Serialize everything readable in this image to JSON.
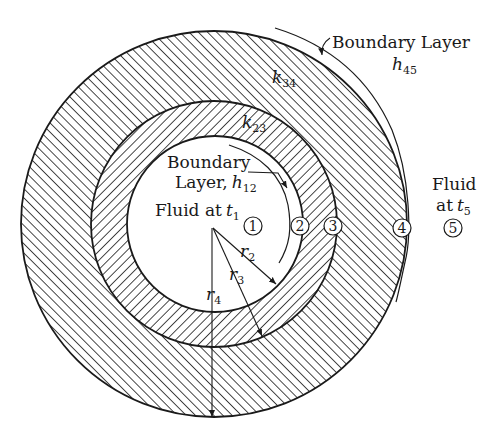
{
  "diagram": {
    "type": "concentric-cylinder-heat-transfer",
    "colors": {
      "ink": "#1a1a1a",
      "background": "#ffffff"
    },
    "geometry": {
      "center": [
        214,
        224
      ],
      "radius_inner": 88,
      "radius_middle": 123,
      "radius_outer": 193
    },
    "labels": {
      "outer_boundary_layer": "Boundary Layer",
      "outer_h": "h",
      "outer_h_sub": "45",
      "k34": "k",
      "k34_sub": "34",
      "k23": "k",
      "k23_sub": "23",
      "inner_boundary_line1": "Boundary",
      "inner_boundary_line2": "Layer,",
      "inner_h": "h",
      "inner_h_sub": "12",
      "inner_fluid": "Fluid at",
      "inner_t": "t",
      "inner_t_sub": "1",
      "outer_fluid_line1": "Fluid",
      "outer_fluid_line2": "at",
      "outer_t": "t",
      "outer_t_sub": "5",
      "r2": "r",
      "r2_sub": "2",
      "r3": "r",
      "r3_sub": "3",
      "r4": "r",
      "r4_sub": "4"
    },
    "nodes": [
      {
        "id": "1",
        "label": "1"
      },
      {
        "id": "2",
        "label": "2"
      },
      {
        "id": "3",
        "label": "3"
      },
      {
        "id": "4",
        "label": "4"
      },
      {
        "id": "5",
        "label": "5"
      }
    ]
  }
}
